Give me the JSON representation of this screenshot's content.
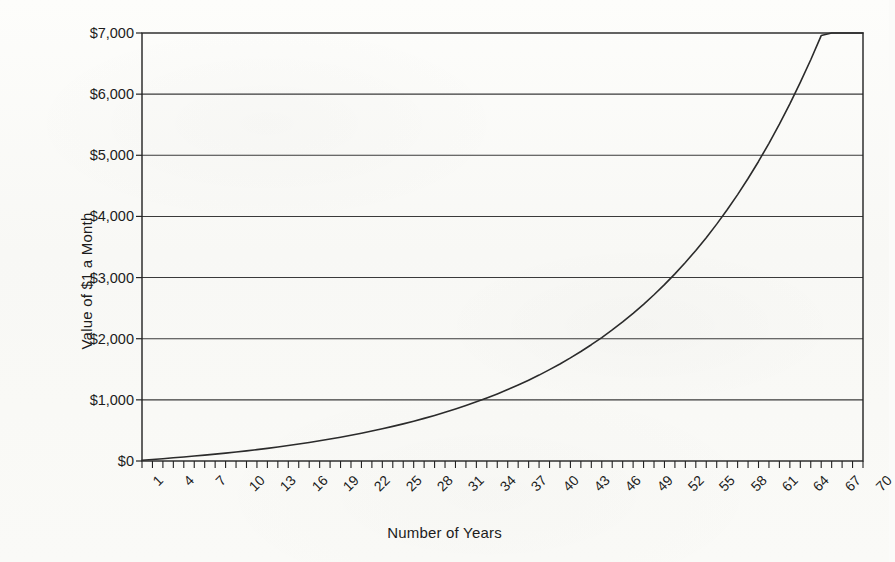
{
  "figure": {
    "background_color": "#fbfbf9",
    "line_color": "#2b2b2b",
    "grid_color": "#3a3a3a",
    "axis_color": "#222222"
  },
  "chart_data": {
    "type": "line",
    "title": "",
    "subtitle": "",
    "xlabel": "Number of Years",
    "ylabel": "Value of $1 a Month",
    "xlim": [
      1,
      70
    ],
    "ylim": [
      0,
      7000
    ],
    "grid": true,
    "grid_axis": "y",
    "legend": false,
    "legend_position": "none",
    "y_tick_labels": [
      "$0",
      "$1,000",
      "$2,000",
      "$3,000",
      "$4,000",
      "$5,000",
      "$6,000",
      "$7,000"
    ],
    "y_tick_values": [
      0,
      1000,
      2000,
      3000,
      4000,
      5000,
      6000,
      7000
    ],
    "x_tick_labels": [
      "1",
      "4",
      "7",
      "10",
      "13",
      "16",
      "19",
      "22",
      "25",
      "28",
      "31",
      "34",
      "37",
      "40",
      "43",
      "46",
      "49",
      "52",
      "55",
      "58",
      "61",
      "64",
      "67",
      "70"
    ],
    "x_tick_values": [
      1,
      4,
      7,
      10,
      13,
      16,
      19,
      22,
      25,
      28,
      31,
      34,
      37,
      40,
      43,
      46,
      49,
      52,
      55,
      58,
      61,
      64,
      67,
      70
    ],
    "x_minor_tick_interval": 1,
    "series": [
      {
        "name": "Value of $1 a Month",
        "x": [
          1,
          2,
          3,
          4,
          5,
          6,
          7,
          8,
          9,
          10,
          11,
          12,
          13,
          14,
          15,
          16,
          17,
          18,
          19,
          20,
          21,
          22,
          23,
          24,
          25,
          26,
          27,
          28,
          29,
          30,
          31,
          32,
          33,
          34,
          35,
          36,
          37,
          38,
          39,
          40,
          41,
          42,
          43,
          44,
          45,
          46,
          47,
          48,
          49,
          50,
          51,
          52,
          53,
          54,
          55,
          56,
          57,
          58,
          59,
          60,
          61,
          62,
          63,
          64,
          65,
          66,
          67,
          68,
          69,
          70
        ],
        "values": [
          12,
          25,
          38,
          52,
          68,
          84,
          101,
          119,
          138,
          158,
          180,
          203,
          227,
          252,
          279,
          308,
          338,
          370,
          403,
          439,
          477,
          517,
          559,
          604,
          651,
          702,
          755,
          811,
          871,
          934,
          1001,
          1073,
          1148,
          1228,
          1313,
          1403,
          1499,
          1600,
          1708,
          1822,
          1944,
          2073,
          2210,
          2355,
          2509,
          2673,
          2846,
          3030,
          3225,
          3432,
          3651,
          3884,
          4130,
          4392,
          4669,
          4963,
          5275,
          5605,
          5956,
          6327,
          6721,
          7139,
          7581,
          8051,
          8549,
          9077,
          9636,
          10230,
          10860,
          11527
        ],
        "display_values": [
          12,
          25,
          38,
          52,
          66,
          81,
          96,
          112,
          129,
          147,
          166,
          186,
          207,
          229,
          253,
          277,
          303,
          330,
          359,
          389,
          421,
          455,
          490,
          527,
          566,
          607,
          651,
          697,
          745,
          796,
          850,
          907,
          967,
          1030,
          1097,
          1168,
          1243,
          1322,
          1405,
          1494,
          1587,
          1686,
          1791,
          1902,
          2019,
          2144,
          2275,
          2415,
          2563,
          2719,
          2885,
          3061,
          3247,
          3444,
          3653,
          3874,
          4109,
          4357,
          4620,
          4899,
          5195,
          5508,
          5840,
          6191,
          6563,
          6958,
          7376,
          7819,
          8289,
          8787
        ],
        "color": "#2b2b2b",
        "line_width": 1.6,
        "marker": "none"
      }
    ],
    "annotations": [
      {
        "label": "crosses $1,000",
        "x": 35,
        "y": 1000
      },
      {
        "label": "crosses $2,000",
        "x": 48,
        "y": 2000
      },
      {
        "label": "crosses $3,000",
        "x": 56,
        "y": 3000
      },
      {
        "label": "crosses $4,000",
        "x": 62,
        "y": 4000
      },
      {
        "label": "crosses $5,000",
        "x": 66,
        "y": 5000
      },
      {
        "label": "endpoint",
        "x": 70,
        "y": 5850
      }
    ]
  }
}
